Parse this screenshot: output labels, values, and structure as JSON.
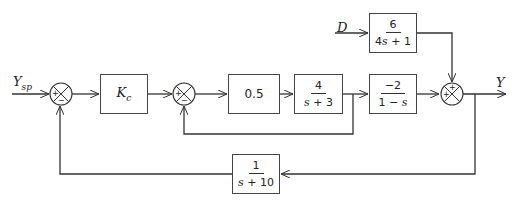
{
  "diagram": {
    "type": "block-diagram",
    "signals": {
      "input": {
        "name": "Y",
        "subscript": "sp"
      },
      "disturbance": "D",
      "output": "Y"
    },
    "blocks": {
      "controller": {
        "label": "K",
        "subscript": "c"
      },
      "gain": {
        "label": "0.5"
      },
      "plant1": {
        "num": "4",
        "den_var": "s",
        "den_rest": " + 3"
      },
      "plant2": {
        "num": "−2",
        "den_pre": "1 − ",
        "den_var": "s"
      },
      "disturbance_tf": {
        "num": "6",
        "den_pre": "4",
        "den_var": "s",
        "den_rest": " + 1"
      },
      "feedback_tf": {
        "num": "1",
        "den_var": "s",
        "den_rest": " + 10"
      }
    },
    "summers": {
      "s1": {
        "top": "+",
        "bottom": "−"
      },
      "s2": {
        "top": "+",
        "bottom": "−"
      },
      "s3": {
        "top": "+",
        "left": "+"
      }
    }
  }
}
